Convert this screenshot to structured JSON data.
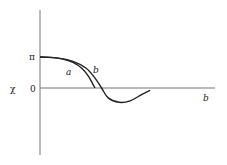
{
  "chart_data": {
    "type": "line",
    "title": "",
    "ylabel": "χ",
    "xlabel": "b",
    "y_ticks": [
      "π",
      "0"
    ],
    "y_tick_values": [
      3.14159,
      0
    ],
    "series": [
      {
        "name": "a",
        "label": "a",
        "points": [
          [
            0,
            3.14159
          ],
          [
            0.1,
            3.1
          ],
          [
            0.2,
            2.95
          ],
          [
            0.3,
            2.6
          ],
          [
            0.38,
            2.0
          ],
          [
            0.44,
            1.2
          ],
          [
            0.48,
            0.4
          ],
          [
            0.5,
            0
          ]
        ]
      },
      {
        "name": "b",
        "label": "b",
        "points": [
          [
            0,
            3.14159
          ],
          [
            0.15,
            3.05
          ],
          [
            0.3,
            2.7
          ],
          [
            0.42,
            2.0
          ],
          [
            0.5,
            1.0
          ],
          [
            0.56,
            0
          ],
          [
            0.62,
            -1.0
          ],
          [
            0.72,
            -1.45
          ],
          [
            0.82,
            -1.3
          ],
          [
            0.92,
            -0.7
          ],
          [
            1.0,
            -0.25
          ]
        ]
      }
    ]
  },
  "labels": {
    "y_axis": "χ",
    "tick_pi": "π",
    "tick_zero": "0",
    "curve_a": "a",
    "curve_b": "b",
    "x_axis": "b"
  }
}
